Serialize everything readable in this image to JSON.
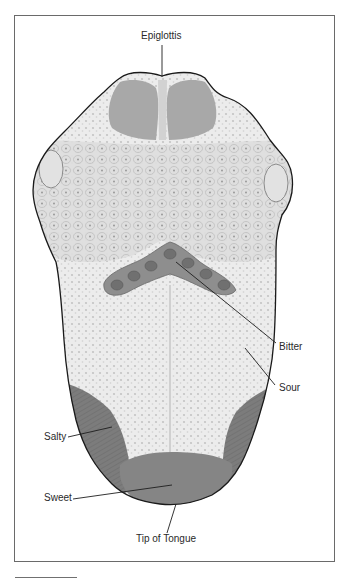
{
  "figure": {
    "labels": {
      "epiglottis": "Epiglottis",
      "bitter": "Bitter",
      "sour": "Sour",
      "salty": "Salty",
      "sweet": "Sweet",
      "tip": "Tip of Tongue"
    },
    "colors": {
      "outline": "#1a1a1a",
      "tongue_base": "#e4e4e4",
      "tongue_light": "#f0f0f0",
      "papillae_region": "#d6d6d6",
      "bitter_region": "#8a8a8a",
      "side_region": "#7e7e7e",
      "sweet_region": "#858585",
      "frame_border": "#6a6a6a",
      "label_text": "#2a2a2a"
    }
  }
}
